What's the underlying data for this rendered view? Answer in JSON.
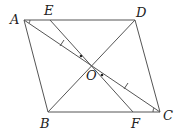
{
  "diagram": {
    "type": "geometry",
    "points": {
      "A": {
        "label": "A",
        "x": 24,
        "y": 20
      },
      "E": {
        "label": "E",
        "x": 50,
        "y": 20
      },
      "D": {
        "label": "D",
        "x": 135,
        "y": 20
      },
      "B": {
        "label": "B",
        "x": 48,
        "y": 112
      },
      "F": {
        "label": "F",
        "x": 133,
        "y": 112
      },
      "C": {
        "label": "C",
        "x": 160,
        "y": 112
      },
      "O": {
        "label": "O",
        "x": 91,
        "y": 65
      }
    },
    "segments": [
      "AD",
      "DC",
      "CB",
      "BA",
      "AC",
      "BD",
      "EF"
    ],
    "line_color": "#555555"
  }
}
